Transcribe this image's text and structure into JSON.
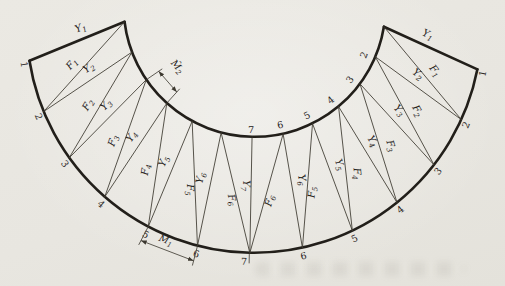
{
  "figure": {
    "background": "#e9e7e1",
    "ink_thick": "#221f1a",
    "ink_thin": "#3c382f",
    "text_color": "#27231c"
  },
  "geometry": {
    "width": 505,
    "height": 286,
    "tilt_deg": 1.1,
    "outer_arc": {
      "cx": 252,
      "cy": 25.5,
      "r": 227.5,
      "end_deg": 170,
      "panels": 6
    },
    "inner_arc": {
      "cx": 252,
      "cy": 6,
      "r": 131,
      "end_deg": 172,
      "panels": 6
    }
  },
  "members": {
    "left_labels": [
      [
        "Y",
        "1"
      ],
      [
        "F",
        "1"
      ],
      [
        "Y",
        "2"
      ],
      [
        "F",
        "2"
      ],
      [
        "Y",
        "3"
      ],
      [
        "F",
        "3"
      ],
      [
        "Y",
        "4"
      ],
      [
        "F",
        "4"
      ],
      [
        "Y",
        "5"
      ],
      [
        "F",
        "5"
      ],
      [
        "Y",
        "6"
      ],
      [
        "F",
        "6"
      ]
    ],
    "right_labels": [
      [
        "Y",
        "1"
      ],
      [
        "F",
        "1"
      ],
      [
        "Y",
        "2"
      ],
      [
        "F",
        "2"
      ],
      [
        "Y",
        "3"
      ],
      [
        "F",
        "3"
      ],
      [
        "Y",
        "4"
      ],
      [
        "F",
        "4"
      ],
      [
        "Y",
        "5"
      ],
      [
        "F",
        "5"
      ],
      [
        "Y",
        "6"
      ],
      [
        "F",
        "6"
      ]
    ],
    "center_label": [
      "Y",
      "7"
    ]
  },
  "node_numbers": {
    "outer_left": [
      "1",
      "2",
      "3",
      "4",
      "5",
      "6"
    ],
    "outer_right": [
      "1",
      "2",
      "3",
      "4",
      "5",
      "6"
    ],
    "inner_right": [
      "2",
      "3",
      "4",
      "5",
      "6"
    ],
    "inner_center": "7",
    "outer_center": "7"
  },
  "dimensions": [
    {
      "base": "M̂",
      "sub": "2",
      "arc": "inner",
      "from_panel": 3,
      "to_panel": 4
    },
    {
      "base": "M̂",
      "sub": "1",
      "arc": "outer",
      "from_panel": 5,
      "to_panel": 6
    }
  ]
}
